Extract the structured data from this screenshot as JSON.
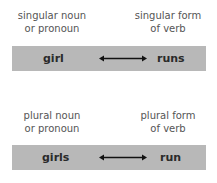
{
  "pairs": [
    {
      "noun_label_line1": "singular noun",
      "noun_label_line2": "or pronoun",
      "verb_label_line1": "singular form",
      "verb_label_line2": "of verb",
      "noun": "girl",
      "verb": "runs"
    },
    {
      "noun_label_line1": "plural noun",
      "noun_label_line2": "or pronoun",
      "verb_label_line1": "plural form",
      "verb_label_line2": "of verb",
      "noun": "girls",
      "verb": "run"
    }
  ],
  "colors": {
    "bar": "#b8b8b8",
    "text": "#555555",
    "word": "#2a2a2a"
  }
}
